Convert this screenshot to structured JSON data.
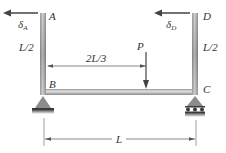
{
  "diagram": {
    "points": {
      "A": "A",
      "B": "B",
      "C": "C",
      "D": "D"
    },
    "load": {
      "label": "P"
    },
    "displacements": {
      "delta_A": {
        "symbol": "δ",
        "subscript": "A"
      },
      "delta_D": {
        "symbol": "δ",
        "subscript": "D"
      }
    },
    "dimensions": {
      "left_column_height": "L/2",
      "right_column_height": "L/2",
      "load_position": "2L/3",
      "span": "L"
    },
    "supports": {
      "B": "pin",
      "C": "roller"
    },
    "colors": {
      "member": "#9a9a9a",
      "member_highlight": "#d8d8d8",
      "support": "#8c8c8c",
      "arrow": "#444444",
      "dimension": "#555555"
    }
  }
}
